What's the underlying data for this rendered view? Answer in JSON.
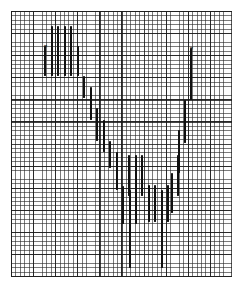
{
  "chart_data": {
    "type": "bar",
    "title": "",
    "subtitle": "",
    "xlabel": "",
    "ylabel": "",
    "grid": true,
    "grid_cell_px": 4.42,
    "grid_major_every": 5,
    "legend": null,
    "annotations": [
      {
        "label": "x",
        "x_index": 0,
        "y_value": 82.0
      },
      {
        "label": "x",
        "x_index": 22,
        "y_value": 83.0
      }
    ],
    "x": [
      0,
      1,
      2,
      3,
      4,
      5,
      6,
      7,
      8,
      9,
      10,
      11,
      12,
      13,
      14,
      15,
      16,
      17,
      18,
      19,
      20,
      21,
      22
    ],
    "xlim": [
      0,
      23
    ],
    "ylim": [
      0,
      100
    ],
    "series": [
      {
        "name": "range",
        "type": "high-low-bar",
        "high": [
          82.0,
          94.5,
          94.5,
          94.5,
          94.5,
          82.0,
          79.0,
          72.0,
          64.5,
          55.0,
          48.5,
          38.0,
          30.0,
          34.5,
          47.0,
          47.0,
          47.0,
          38.0,
          30.0,
          38.0,
          47.0,
          62.0,
          83.0
        ],
        "low": [
          63.0,
          63.0,
          63.0,
          63.0,
          63.0,
          63.0,
          70.5,
          63.0,
          55.5,
          46.5,
          38.5,
          22.0,
          8.0,
          18.5,
          30.5,
          30.5,
          30.5,
          22.5,
          18.5,
          8.0,
          28.5,
          45.0,
          62.0
        ]
      }
    ],
    "bars_px": [
      {
        "x": 44.0,
        "top": 45.5,
        "bottom": 75.5
      },
      {
        "x": 50.5,
        "top": 26.0,
        "bottom": 75.5
      },
      {
        "x": 57.0,
        "top": 26.0,
        "bottom": 75.5
      },
      {
        "x": 63.5,
        "top": 26.0,
        "bottom": 75.5
      },
      {
        "x": 70.0,
        "top": 26.0,
        "bottom": 75.5
      },
      {
        "x": 76.5,
        "top": 45.5,
        "bottom": 75.5
      },
      {
        "x": 83.0,
        "top": 75.5,
        "bottom": 97.5
      },
      {
        "x": 89.5,
        "top": 86.5,
        "bottom": 119.5
      },
      {
        "x": 96.0,
        "top": 108.0,
        "bottom": 141.0
      },
      {
        "x": 102.5,
        "top": 119.5,
        "bottom": 152.0
      },
      {
        "x": 109.0,
        "top": 141.0,
        "bottom": 168.0
      },
      {
        "x": 115.5,
        "top": 152.0,
        "bottom": 190.0
      },
      {
        "x": 122.0,
        "top": 186.0,
        "bottom": 224.0
      },
      {
        "x": 128.5,
        "top": 190.0,
        "bottom": 268.0
      },
      {
        "x": 135.0,
        "top": 168.0,
        "bottom": 224.0
      },
      {
        "x": 128.0,
        "top": 155.0,
        "bottom": 196.0
      },
      {
        "x": 134.5,
        "top": 155.0,
        "bottom": 196.0
      },
      {
        "x": 141.0,
        "top": 155.0,
        "bottom": 196.0
      },
      {
        "x": 147.5,
        "top": 185.0,
        "bottom": 222.0
      },
      {
        "x": 154.0,
        "top": 185.0,
        "bottom": 222.0
      },
      {
        "x": 160.5,
        "top": 190.0,
        "bottom": 268.0
      },
      {
        "x": 167.0,
        "top": 185.0,
        "bottom": 222.0
      },
      {
        "x": 170.5,
        "top": 173.0,
        "bottom": 213.0
      },
      {
        "x": 177.0,
        "top": 155.0,
        "bottom": 196.0
      },
      {
        "x": 177.5,
        "top": 130.0,
        "bottom": 173.0
      },
      {
        "x": 184.0,
        "top": 100.0,
        "bottom": 143.0
      },
      {
        "x": 190.0,
        "top": 48.0,
        "bottom": 100.0
      }
    ],
    "markers_px": [
      {
        "x": 43.0,
        "y": 43.5
      },
      {
        "x": 189.0,
        "y": 45.5
      }
    ]
  },
  "page": {
    "background_color": "#ffffff",
    "grid_color": "#2a2a2a",
    "bar_color": "#101010",
    "canvas_width": 243,
    "canvas_height": 289
  }
}
